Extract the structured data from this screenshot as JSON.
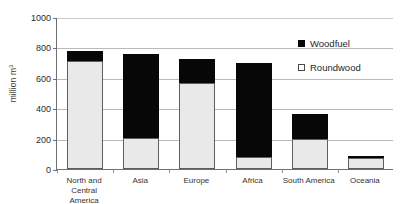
{
  "chart_data": {
    "type": "bar",
    "stacked": true,
    "title": "",
    "subtitle": "",
    "xlabel": "",
    "ylabel": "million m3",
    "ylabel_display": "million m",
    "ylabel_superscript": "3",
    "ylim": [
      0,
      1000
    ],
    "ytick_step": 200,
    "ytick_labels": [
      "0",
      "200",
      "400",
      "600",
      "800",
      "1000"
    ],
    "ytick_values": [
      0,
      200,
      400,
      600,
      800,
      1000
    ],
    "grid": "horizontal",
    "legend_position": "inside-top-right",
    "categories": [
      "North and Central America",
      "Asia",
      "Europe",
      "Africa",
      "South America",
      "Oceania"
    ],
    "series": [
      {
        "name": "Roundwood",
        "color": "#e9e9e9",
        "border_color": "#5e5e5e",
        "values": [
          710,
          205,
          565,
          80,
          195,
          75
        ]
      },
      {
        "name": "Woodfuel",
        "color": "#070707",
        "border_color": "#070707",
        "values": [
          65,
          550,
          160,
          620,
          170,
          3
        ]
      }
    ],
    "totals": [
      775,
      755,
      725,
      700,
      365,
      78
    ]
  },
  "legend": {
    "items": [
      {
        "label": "Woodfuel",
        "swatch": "filled-square-icon"
      },
      {
        "label": "Roundwood",
        "swatch": "open-square-icon"
      }
    ]
  },
  "axes": {
    "y_title": "million m",
    "y_title_superscript": "3"
  }
}
